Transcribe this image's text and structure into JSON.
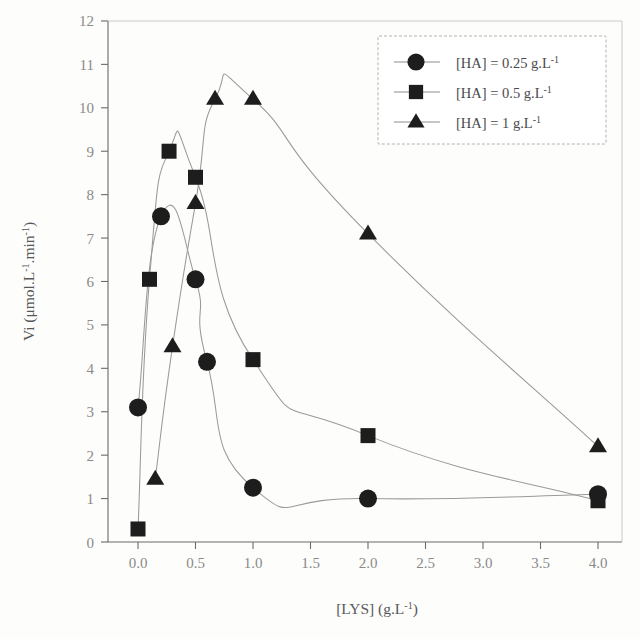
{
  "chart_data": {
    "type": "line",
    "title": "",
    "xlabel": "[LYS] (g.L-1)",
    "xlabel_parts": {
      "name": "[LYS]",
      "unit_base": " (g.L",
      "unit_exp": "-1",
      "unit_close": ")"
    },
    "ylabel": "Vi (umol.L-1.min-1)",
    "ylabel_parts": {
      "prefix": "Vi (μmol.L",
      "exp1": "-1",
      "mid": ".min",
      "exp2": "-1",
      "suffix": ")"
    },
    "xlim": [
      -0.25,
      4.3
    ],
    "ylim": [
      0,
      12
    ],
    "xticks": [
      0.0,
      0.5,
      1.0,
      1.5,
      2.0,
      2.5,
      3.0,
      3.5,
      4.0
    ],
    "xtick_labels": [
      "0.0",
      "0.5",
      "1.0",
      "1.5",
      "2.0",
      "2.5",
      "3.0",
      "3.5",
      "4.0"
    ],
    "yticks": [
      0,
      1,
      2,
      3,
      4,
      5,
      6,
      7,
      8,
      9,
      10,
      11,
      12
    ],
    "ytick_labels": [
      "0",
      "1",
      "2",
      "3",
      "4",
      "5",
      "6",
      "7",
      "8",
      "9",
      "10",
      "11",
      "12"
    ],
    "grid": false,
    "legend_position": "top-right",
    "marker_color": "#1d1d1d",
    "line_color": "#9a9a98",
    "axis_color": "#6b6b6b",
    "series": [
      {
        "name": "[HA] = 0.25 g.L-1",
        "label_parts": {
          "prefix": "[HA] = ",
          "value": "0.25",
          "unit": " g.L",
          "exp": "-1"
        },
        "marker": "circle",
        "x": [
          0.0,
          0.2,
          0.5,
          0.6,
          1.0,
          2.0,
          4.0
        ],
        "y": [
          3.1,
          7.5,
          6.05,
          4.15,
          1.25,
          1.0,
          1.1
        ]
      },
      {
        "name": "[HA] = 0.5 g.L-1",
        "label_parts": {
          "prefix": "[HA] = ",
          "value": "0.5",
          "unit": " g.L",
          "exp": "-1"
        },
        "marker": "square",
        "x": [
          0.0,
          0.1,
          0.27,
          0.5,
          1.0,
          2.0,
          4.0
        ],
        "y": [
          0.3,
          6.05,
          9.0,
          8.4,
          4.2,
          2.45,
          0.95
        ]
      },
      {
        "name": "[HA] = 1 g.L-1",
        "label_parts": {
          "prefix": "[HA] = ",
          "value": "1",
          "unit": " g.L",
          "exp": "-1"
        },
        "marker": "triangle",
        "x": [
          0.15,
          0.3,
          0.5,
          0.67,
          1.0,
          2.0,
          4.0
        ],
        "y": [
          1.45,
          4.5,
          7.8,
          10.2,
          10.2,
          7.1,
          2.2
        ]
      }
    ]
  }
}
